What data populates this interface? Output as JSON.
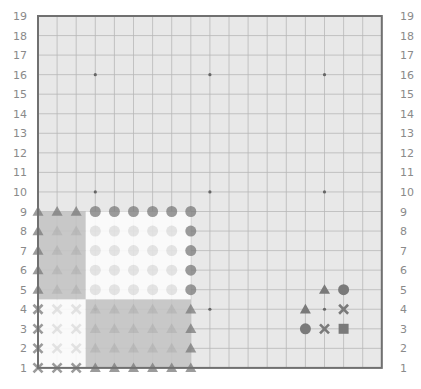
{
  "board": {
    "size": 19,
    "background": "#e8e8e8",
    "grid_color": "#b8b8b8",
    "border_color": "#707070",
    "star_color": "#666666",
    "marker_color": "#7a7a7a",
    "origin_x": 38,
    "origin_y": 16,
    "step_x": 19.1,
    "step_y": 19.55,
    "row_labels": [
      "19",
      "18",
      "17",
      "16",
      "15",
      "14",
      "13",
      "12",
      "11",
      "10",
      "9",
      "8",
      "7",
      "6",
      "5",
      "4",
      "3",
      "2",
      "1"
    ],
    "star_points": [
      [
        4,
        16
      ],
      [
        10,
        16
      ],
      [
        16,
        16
      ],
      [
        4,
        10
      ],
      [
        10,
        10
      ],
      [
        16,
        10
      ],
      [
        4,
        4
      ],
      [
        10,
        4
      ],
      [
        16,
        4
      ]
    ]
  },
  "overlay": {
    "cols": [
      1,
      9
    ],
    "rows": [
      1,
      9
    ],
    "regions": [
      {
        "name": "top-left",
        "cols": [
          1,
          3
        ],
        "rows": [
          5,
          9
        ],
        "fill": "#c4c4c4",
        "marker": "triangle"
      },
      {
        "name": "top-right",
        "cols": [
          4,
          9
        ],
        "rows": [
          5,
          9
        ],
        "fill": "#fbfbfb",
        "marker": "circle"
      },
      {
        "name": "bottom-left",
        "cols": [
          1,
          3
        ],
        "rows": [
          1,
          4
        ],
        "fill": "#fbfbfb",
        "marker": "cross"
      },
      {
        "name": "bottom-right",
        "cols": [
          4,
          9
        ],
        "rows": [
          1,
          4
        ],
        "fill": "#c4c4c4",
        "marker": "triangle"
      }
    ]
  },
  "markers": [
    {
      "col": 16,
      "row": 5,
      "shape": "triangle"
    },
    {
      "col": 17,
      "row": 5,
      "shape": "circle"
    },
    {
      "col": 15,
      "row": 4,
      "shape": "triangle"
    },
    {
      "col": 17,
      "row": 4,
      "shape": "cross"
    },
    {
      "col": 15,
      "row": 3,
      "shape": "circle"
    },
    {
      "col": 16,
      "row": 3,
      "shape": "cross"
    },
    {
      "col": 17,
      "row": 3,
      "shape": "square"
    }
  ]
}
